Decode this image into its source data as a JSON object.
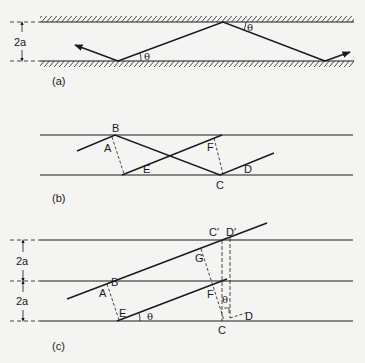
{
  "figure": {
    "panels": [
      {
        "id": "a",
        "caption": "(a)",
        "dimension_label": "2a",
        "angle_labels": [
          "θ",
          "θ"
        ]
      },
      {
        "id": "b",
        "caption": "(b)",
        "point_labels": {
          "A": "A",
          "B": "B",
          "C": "C",
          "D": "D",
          "E": "E",
          "F": "F"
        }
      },
      {
        "id": "c",
        "caption": "(c)",
        "dimension_labels": [
          "2a",
          "2a"
        ],
        "point_labels": {
          "A": "A",
          "B": "B",
          "C": "C",
          "C_prime": "C′",
          "D": "D",
          "D_prime": "D′",
          "E": "E",
          "F": "F",
          "G": "G"
        },
        "angle_labels": [
          "θ",
          "θ"
        ]
      }
    ],
    "colors": {
      "ink": "#1a1a1a",
      "paper": "#f4f4f2"
    }
  }
}
